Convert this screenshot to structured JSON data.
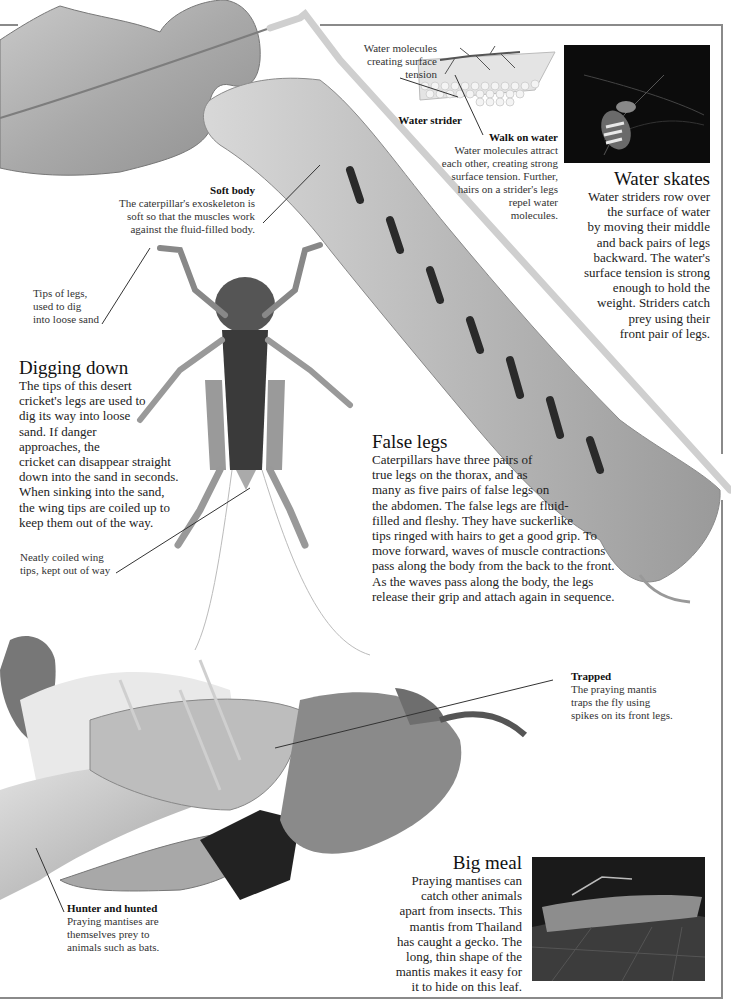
{
  "page": {
    "accent_border_color": "#8a8a8a"
  },
  "water_molecules_label": "Water molecules\ncreating surface\ntension",
  "water_strider_label": "Water strider",
  "walk_on_water": {
    "title": "Walk on water",
    "text": "Water molecules attract\neach other, creating strong\nsurface tension. Further,\nhairs on a strider's legs\nrepel water\nmolecules."
  },
  "water_skates": {
    "title": "Water skates",
    "text": "Water striders row over\nthe surface of water\nby moving their middle\nand back pairs of legs\nbackward. The water's\nsurface tension is strong\nenough to hold the\nweight. Striders catch\nprey using their\nfront pair of legs."
  },
  "soft_body": {
    "title": "Soft body",
    "text": "The caterpillar's exoskeleton is\nsoft so that the muscles work\nagainst the fluid-filled body."
  },
  "tips_of_legs_label": "Tips of legs,\nused to dig\ninto loose sand",
  "digging_down": {
    "title": "Digging down",
    "text_narrow": "The tips of this desert\ncricket's legs are used to\ndig its way into loose\nsand. If danger\napproaches, the",
    "text_wide": "cricket can disappear straight\ndown into the sand in seconds.\nWhen sinking into the sand,\nthe wing tips are coiled up to\nkeep them out of the way."
  },
  "wing_tips_label": "Neatly coiled wing\ntips, kept out of way",
  "false_legs": {
    "title": "False legs",
    "text": "Caterpillars have three pairs of\ntrue legs on the thorax, and as\nmany as five pairs of false legs on\nthe abdomen. The false legs are fluid-\nfilled and fleshy. They have suckerlike\ntips ringed with hairs to get a good grip. To\nmove forward, waves of muscle contractions\npass along the body from the back to the front.\nAs the waves pass along the body, the legs\nrelease their grip and attach again in sequence."
  },
  "trapped": {
    "title": "Trapped",
    "text": "The praying mantis\ntraps the fly using\nspikes on its front legs."
  },
  "hunter_and_hunted": {
    "title": "Hunter and hunted",
    "text": "Praying mantises are\nthemselves prey to\nanimals such as bats."
  },
  "big_meal": {
    "title": "Big meal",
    "text": "Praying mantises can\ncatch other animals\napart from insects. This\nmantis from Thailand\nhas caught a gecko. The\nlong, thin shape of the\nmantis makes it easy for\nit to hide on this leaf."
  },
  "images": {
    "leaf": "leaf-photo",
    "caterpillar": "caterpillar-photo",
    "cricket": "desert-cricket-photo",
    "strider_diagram": "water-strider-diagram",
    "strider_photo": "water-strider-photo",
    "mantis": "praying-mantis-photo",
    "gecko_photo": "mantis-gecko-photo"
  }
}
